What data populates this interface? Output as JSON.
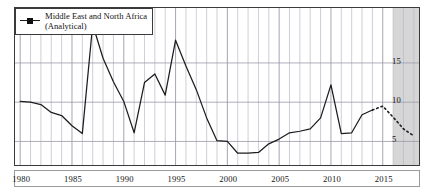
{
  "legend": {
    "line1": "Middle East and North Africa",
    "line2": "(Analytical)",
    "marker_icon": "line-with-square-marker-icon"
  },
  "axes": {
    "y_ticks": [
      "15",
      "10",
      "5"
    ],
    "x_ticks": [
      "1980",
      "1985",
      "1990",
      "1995",
      "2000",
      "2005",
      "2010",
      "2015"
    ]
  },
  "colors": {
    "line": "#1c1c1c",
    "grid": "#b9b9c6",
    "frame": "#3a3a3a",
    "forecast_shade": "#cfcfcf",
    "background": "#ffffff"
  },
  "chart_data": {
    "type": "line",
    "title": "",
    "subtitle": "",
    "xlabel": "",
    "ylabel": "",
    "xlim": [
      1979.5,
      2018.5
    ],
    "ylim": [
      2.0,
      22.0
    ],
    "grid": true,
    "legend_position": "top-left",
    "x_tick_values": [
      1980,
      1985,
      1990,
      1995,
      2000,
      2005,
      2010,
      2015
    ],
    "y_tick_values": [
      5,
      10,
      15
    ],
    "annotations": [
      {
        "type": "shaded-region",
        "label": "forecast",
        "x_start": 2016.0,
        "x_end": 2018.5
      }
    ],
    "series": [
      {
        "name": "Middle East and North Africa (Analytical)",
        "style": "solid",
        "x": [
          1980,
          1981,
          1982,
          1983,
          1984,
          1985,
          1986,
          1987,
          1988,
          1989,
          1990,
          1991,
          1992,
          1993,
          1994,
          1995,
          1996,
          1997,
          1998,
          1999,
          2000,
          2001,
          2002,
          2003,
          2004,
          2005,
          2006,
          2007,
          2008,
          2009,
          2010,
          2011,
          2012,
          2013,
          2014
        ],
        "values": [
          10.1,
          10.0,
          9.7,
          8.7,
          8.3,
          7.0,
          6.0,
          19.9,
          15.6,
          12.6,
          10.1,
          6.1,
          12.5,
          13.6,
          10.9,
          17.9,
          14.6,
          11.6,
          8.0,
          5.1,
          5.0,
          3.5,
          3.5,
          3.6,
          4.7,
          5.3,
          6.1,
          6.3,
          6.6,
          8.0,
          12.2,
          6.0,
          6.1,
          8.4,
          9.0
        ]
      },
      {
        "name": "Middle East and North Africa (Analytical) — projection",
        "style": "dashed",
        "x": [
          2014,
          2015,
          2016,
          2017,
          2018
        ],
        "values": [
          9.0,
          9.5,
          8.1,
          6.6,
          5.7
        ]
      }
    ]
  }
}
